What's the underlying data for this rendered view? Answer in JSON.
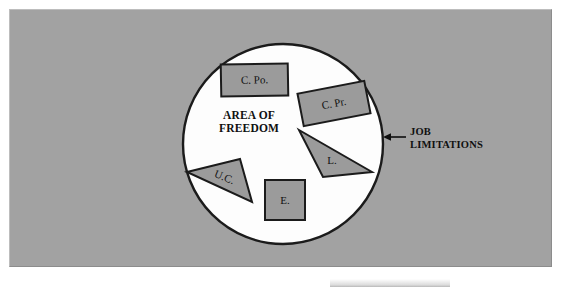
{
  "figure": {
    "kind": "venn-style-area-diagram",
    "background_color": "#a2a2a2",
    "circle_fill": "#fdfdfd",
    "outline_color": "#1b1b1b",
    "shape_fill": "#9b9b9b"
  },
  "circle": {
    "label_line1": "AREA OF",
    "label_line2": "FREEDOM",
    "center_x": 283,
    "center_y": 144,
    "radius": 100
  },
  "callout": {
    "label_line1": "JOB",
    "label_line2": "LIMITATIONS",
    "arrow_direction": "left",
    "points_at": "circle-boundary"
  },
  "shapes": [
    {
      "id": "c-po",
      "label": "C. Po.",
      "type": "rectangle",
      "x": 221,
      "y": 64,
      "width": 67,
      "height": 32,
      "rotation": -1
    },
    {
      "id": "c-pr",
      "label": "C. Pr.",
      "type": "rectangle",
      "x": 300,
      "y": 87,
      "width": 68,
      "height": 33,
      "rotation": -11
    },
    {
      "id": "l",
      "label": "L.",
      "type": "triangle",
      "points": "299,130 372,172 323,177",
      "label_x": 332,
      "label_y": 161,
      "rotation": 0
    },
    {
      "id": "u-c",
      "label": "U.C.",
      "type": "triangle",
      "points": "187,172 240,159 252,202",
      "label_x": 224,
      "label_y": 178,
      "rotation": 22
    },
    {
      "id": "e",
      "label": "E.",
      "type": "rectangle",
      "x": 265,
      "y": 180,
      "width": 40,
      "height": 40,
      "rotation": 0
    }
  ]
}
